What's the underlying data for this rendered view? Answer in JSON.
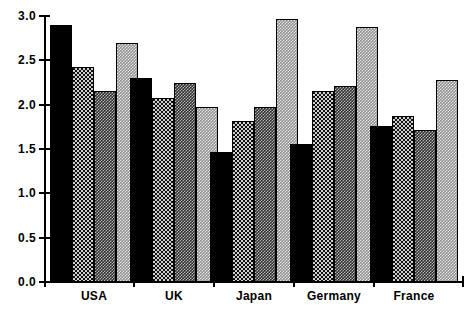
{
  "chart_data": {
    "type": "bar",
    "title": "",
    "subtitle": "",
    "xlabel": "",
    "ylabel": "",
    "categories": [
      "USA",
      "UK",
      "Japan",
      "Germany",
      "France"
    ],
    "series": [
      {
        "name": "Series 1",
        "fill": "solid",
        "values": [
          2.9,
          2.3,
          1.47,
          1.56,
          1.76
        ]
      },
      {
        "name": "Series 2",
        "fill": "dark",
        "values": [
          2.42,
          2.08,
          1.82,
          2.15,
          1.87
        ]
      },
      {
        "name": "Series 3",
        "fill": "medium",
        "values": [
          2.15,
          2.24,
          1.97,
          2.21,
          1.71
        ]
      },
      {
        "name": "Series 4",
        "fill": "light",
        "values": [
          2.7,
          1.97,
          2.97,
          2.88,
          2.28
        ]
      }
    ],
    "ylim": [
      0.0,
      3.0
    ],
    "yticks": [
      "0.0",
      "0.5",
      "1.0",
      "1.5",
      "2.0",
      "2.5",
      "3.0"
    ],
    "ytick_values": [
      0.0,
      0.5,
      1.0,
      1.5,
      2.0,
      2.5,
      3.0
    ],
    "grid": false,
    "legend": "none",
    "colors": {
      "axis": "#000000",
      "text": "#000000",
      "background": "#ffffff",
      "bar_solid": "#000000",
      "bar_dark": "#3a3a3a",
      "bar_medium": "#707070",
      "bar_light": "#b4b4b4"
    }
  }
}
